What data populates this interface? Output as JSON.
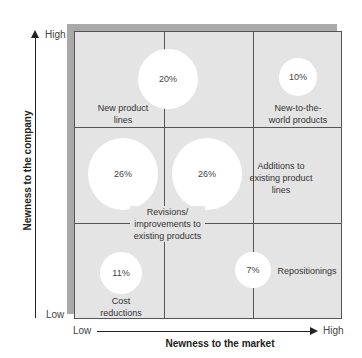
{
  "diagram": {
    "y_axis": {
      "title": "Newness to the company",
      "high": "High",
      "low": "Low"
    },
    "x_axis": {
      "title": "Newness to the market",
      "high": "High",
      "low": "Low"
    },
    "categories": [
      {
        "name": "New product lines",
        "label_line1": "New product",
        "label_line2": "lines",
        "percent": "20%"
      },
      {
        "name": "New-to-the-world products",
        "label_line1": "New-to-the-",
        "label_line2": "world products",
        "percent": "10%"
      },
      {
        "name": "Revisions/improvements to existing products",
        "label_line1": "Revisions/",
        "label_line2": "improvements to",
        "label_line3": "existing products",
        "percent": "26%"
      },
      {
        "name": "Additions to existing product lines",
        "label_line1": "Additions to",
        "label_line2": "existing product",
        "label_line3": "lines",
        "percent": "26%"
      },
      {
        "name": "Cost reductions",
        "label_line1": "Cost",
        "label_line2": "reductions",
        "percent": "11%"
      },
      {
        "name": "Repositionings",
        "label_line1": "Repositionings",
        "percent": "7%"
      }
    ]
  },
  "colors": {
    "grid_fill": "#e4e4e4",
    "shadow": "#a9a9a9",
    "bubble": "#ffffff",
    "line": "#555555"
  }
}
